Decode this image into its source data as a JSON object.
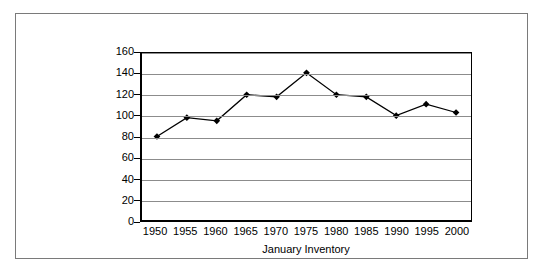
{
  "chart_data": {
    "type": "line",
    "title": "",
    "xlabel": "January Inventory",
    "ylabel": "Million of Head",
    "categories": [
      "1950",
      "1955",
      "1960",
      "1965",
      "1970",
      "1975",
      "1980",
      "1985",
      "1990",
      "1995",
      "2000"
    ],
    "values": [
      80,
      98,
      95,
      120,
      118,
      141,
      120,
      118,
      100,
      111,
      103
    ],
    "series": [
      {
        "name": "January Inventory",
        "values": [
          80,
          98,
          95,
          120,
          118,
          141,
          120,
          118,
          100,
          111,
          103
        ]
      }
    ],
    "ylim": [
      0,
      160
    ],
    "yticks": [
      0,
      20,
      40,
      60,
      80,
      100,
      120,
      140,
      160
    ],
    "ytick_labels": [
      "0",
      "20",
      "40",
      "60",
      "80",
      "100",
      "120",
      "140",
      "160"
    ],
    "xtick_labels": [
      "1950",
      "1955",
      "1960",
      "1965",
      "1970",
      "1975",
      "1980",
      "1985",
      "1990",
      "1995",
      "2000"
    ],
    "grid": "horizontal",
    "legend": "none",
    "marker": "diamond",
    "line_color": "#000000",
    "marker_color": "#000000",
    "grid_color": "#8c8c8c",
    "axis_color": "#000000",
    "background_color": "#ffffff",
    "frame_color": "#7a7a7a"
  }
}
